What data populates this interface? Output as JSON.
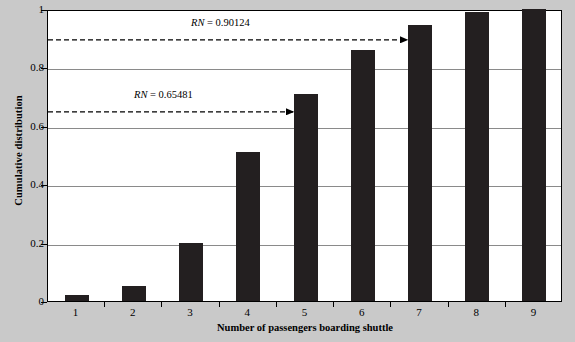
{
  "chart_data": {
    "type": "bar",
    "title": "",
    "subtitle": "",
    "xlabel": "Number of passengers boarding shuttle",
    "ylabel": "Cumulative distribution",
    "categories": [
      "1",
      "2",
      "3",
      "4",
      "5",
      "6",
      "7",
      "8",
      "9"
    ],
    "values": [
      0.02,
      0.05,
      0.2,
      0.51,
      0.71,
      0.86,
      0.945,
      0.99,
      1.0
    ],
    "series": [
      {
        "name": "Cumulative distribution",
        "values": [
          0.02,
          0.05,
          0.2,
          0.51,
          0.71,
          0.86,
          0.945,
          0.99,
          1.0
        ]
      }
    ],
    "xlim": [
      0.5,
      9.5
    ],
    "ylim": [
      0,
      1
    ],
    "ytick_labels": [
      "0",
      "0.2",
      "0.4",
      "0.6",
      "0.8",
      "1"
    ],
    "ytick_values": [
      0,
      0.2,
      0.4,
      0.6,
      0.8,
      1
    ],
    "xtick_labels": [
      "1",
      "2",
      "3",
      "4",
      "5",
      "6",
      "7",
      "8",
      "9"
    ],
    "grid": true,
    "grid_axis": "y",
    "legend": false,
    "legend_position": "none",
    "bar_color": "#231f20",
    "plot_background": "#ffffff",
    "figure_background": "#c9c9c9",
    "gridline_color": "#8a8a8a",
    "annotations": [
      {
        "id": "rn-upper",
        "label_prefix": "RN",
        "label_equals": " = ",
        "label_value": "0.90124",
        "label_full": "RN = 0.90124",
        "y_value": 0.90124,
        "arrow_from_x": 0.5,
        "arrow_to_category": "7",
        "style": "dashed-arrow"
      },
      {
        "id": "rn-lower",
        "label_prefix": "RN",
        "label_equals": " = ",
        "label_value": "0.65481",
        "label_full": "RN = 0.65481",
        "y_value": 0.65481,
        "arrow_from_x": 0.5,
        "arrow_to_category": "5",
        "style": "dashed-arrow"
      }
    ]
  }
}
